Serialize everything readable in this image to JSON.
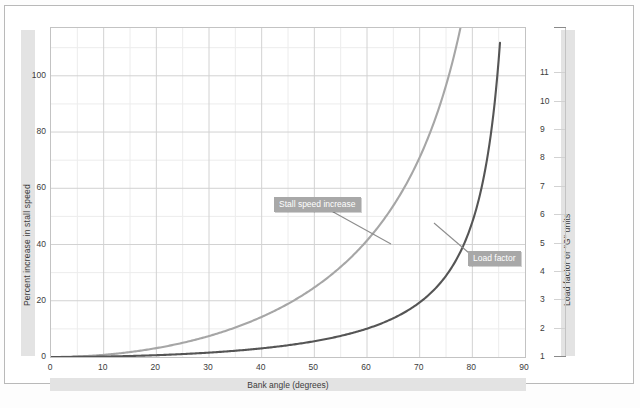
{
  "chart_data": {
    "type": "line",
    "title": "",
    "xlabel": "Bank angle (degrees)",
    "ylabel": "Percent increase in stall speed",
    "y2label": "Load factor or \"G\" units",
    "xlim": [
      0,
      90
    ],
    "ylim": [
      0,
      117
    ],
    "y2lim": [
      1,
      12.6
    ],
    "grid": true,
    "legend_position": "inline-callouts",
    "xticks": [
      "0",
      "10",
      "20",
      "30",
      "40",
      "50",
      "60",
      "70",
      "80",
      "90"
    ],
    "yticks": [
      "0",
      "20",
      "40",
      "60",
      "80",
      "100"
    ],
    "y2ticks": [
      "1",
      "2",
      "3",
      "4",
      "5",
      "6",
      "7",
      "8",
      "9",
      "10",
      "11"
    ],
    "series": [
      {
        "name": "Stall speed increase",
        "color": "#a6a6a6",
        "axis": "left",
        "x": [
          0,
          5,
          10,
          15,
          20,
          25,
          30,
          35,
          40,
          45,
          50,
          55,
          60,
          65,
          70,
          75,
          78,
          80,
          82,
          84
        ],
        "values": [
          0,
          0.2,
          0.8,
          1.8,
          3.2,
          5.0,
          7.5,
          10.5,
          14.2,
          19.0,
          24.8,
          32.0,
          41.4,
          53.7,
          71.1,
          96.6,
          119.0,
          140.0,
          168.0,
          202.0
        ]
      },
      {
        "name": "Load factor",
        "color": "#555555",
        "axis": "right",
        "x": [
          0,
          5,
          10,
          15,
          20,
          25,
          30,
          35,
          40,
          45,
          50,
          55,
          60,
          65,
          70,
          75,
          78,
          80,
          82,
          84,
          86
        ],
        "values": [
          1.0,
          1.004,
          1.015,
          1.035,
          1.064,
          1.103,
          1.155,
          1.221,
          1.305,
          1.414,
          1.556,
          1.743,
          2.0,
          2.366,
          2.924,
          3.864,
          4.81,
          5.76,
          7.19,
          9.57,
          14.34
        ]
      }
    ],
    "annotations": [
      {
        "name": "stall-speed-increase",
        "label": "Stall speed increase",
        "points_to_series": "Stall speed increase"
      },
      {
        "name": "load-factor",
        "label": "Load factor",
        "points_to_series": "Load factor"
      }
    ]
  },
  "axes": {
    "left": {
      "label": "Percent increase in stall speed",
      "ticks": [
        "100",
        "80",
        "60",
        "40",
        "20",
        "0"
      ]
    },
    "right": {
      "label": "Load factor or \"G\" units",
      "ticks": [
        "11",
        "10",
        "9",
        "8",
        "7",
        "6",
        "5",
        "4",
        "3",
        "2",
        "1"
      ]
    },
    "bottom": {
      "label": "Bank angle (degrees)",
      "ticks": [
        "0",
        "10",
        "20",
        "30",
        "40",
        "50",
        "60",
        "70",
        "80",
        "90"
      ]
    }
  },
  "callouts": {
    "stall": "Stall speed increase",
    "load": "Load factor"
  },
  "caption": "",
  "colors": {
    "stall_curve": "#a6a6a6",
    "load_curve": "#555555",
    "callout_bg": "#a8a8a8",
    "band_bg": "#e3e3e3",
    "grid_major": "#cfcfcf",
    "grid_minor": "#e8e8e8",
    "frame": "#b9b9b9"
  }
}
